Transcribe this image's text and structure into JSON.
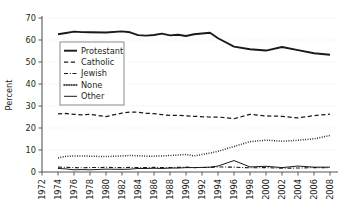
{
  "chart_data": {
    "type": "line",
    "title": "",
    "subtitle": "",
    "xlabel": "",
    "ylabel": "Percent",
    "xlim": [
      1972,
      2009
    ],
    "ylim": [
      0,
      70
    ],
    "grid": true,
    "legend_position": "inside-upper-left",
    "x_tick_labels": [
      "1972",
      "1974",
      "1976",
      "1978",
      "1980",
      "1982",
      "1984",
      "1986",
      "1988",
      "1990",
      "1992",
      "1994",
      "1996",
      "1998",
      "2000",
      "2002",
      "2004",
      "2006",
      "2008"
    ],
    "y_tick_labels": [
      "0",
      "10",
      "20",
      "30",
      "40",
      "50",
      "60",
      "70"
    ],
    "y_ticks": [
      0,
      10,
      20,
      30,
      40,
      50,
      60,
      70
    ],
    "x": [
      1974,
      1975,
      1976,
      1977,
      1978,
      1980,
      1982,
      1983,
      1984,
      1985,
      1986,
      1987,
      1988,
      1989,
      1990,
      1991,
      1993,
      1994,
      1996,
      1998,
      2000,
      2002,
      2004,
      2006,
      2008
    ],
    "series": [
      {
        "name": "Protestant",
        "style": "solid-thick",
        "values": [
          62.6,
          63.2,
          63.8,
          63.6,
          63.5,
          63.4,
          63.9,
          63.5,
          62.2,
          62.0,
          62.3,
          62.9,
          62.1,
          62.4,
          61.8,
          62.6,
          63.3,
          60.8,
          57.0,
          55.8,
          55.2,
          56.8,
          55.4,
          54.0,
          53.3
        ]
      },
      {
        "name": "Catholic",
        "style": "dashed",
        "values": [
          26.4,
          26.6,
          26.2,
          26.0,
          26.2,
          25.2,
          26.8,
          27.2,
          27.2,
          26.7,
          26.5,
          26.1,
          25.7,
          25.8,
          25.5,
          25.3,
          25.0,
          25.0,
          24.2,
          26.2,
          25.5,
          25.3,
          24.6,
          25.6,
          26.3
        ]
      },
      {
        "name": "Jewish",
        "style": "dash-dot",
        "values": [
          2.2,
          2.1,
          2.0,
          1.9,
          2.0,
          2.1,
          2.0,
          2.1,
          2.0,
          2.0,
          2.1,
          2.0,
          2.0,
          2.1,
          2.2,
          2.0,
          2.1,
          2.3,
          2.2,
          1.9,
          2.0,
          1.7,
          1.8,
          2.0,
          1.9
        ]
      },
      {
        "name": "None",
        "style": "dotted",
        "values": [
          6.4,
          7.1,
          7.3,
          7.3,
          7.2,
          7.0,
          7.3,
          7.5,
          7.4,
          7.2,
          7.2,
          7.3,
          7.5,
          7.7,
          8.0,
          7.3,
          8.6,
          9.4,
          11.6,
          13.8,
          14.5,
          14.0,
          14.4,
          15.1,
          16.6
        ]
      },
      {
        "name": "Other",
        "style": "solid-thin",
        "values": [
          1.6,
          1.4,
          1.0,
          1.1,
          1.0,
          1.3,
          1.2,
          1.3,
          1.6,
          1.6,
          1.7,
          1.6,
          1.8,
          1.8,
          2.0,
          2.0,
          2.2,
          2.7,
          5.2,
          2.3,
          2.6,
          2.0,
          2.7,
          2.2,
          2.2
        ]
      }
    ],
    "legend_entries": [
      {
        "label": "Protestant",
        "style": "solid-thick"
      },
      {
        "label": "Catholic",
        "style": "dashed"
      },
      {
        "label": "Jewish",
        "style": "dash-dot"
      },
      {
        "label": "None",
        "style": "dotted"
      },
      {
        "label": "Other",
        "style": "solid-thin"
      }
    ],
    "colors": {
      "line": "#1a1a1a",
      "axis": "#58595b",
      "grid": "#e8dede",
      "background": "#ffffff",
      "text": "#231f20"
    }
  }
}
